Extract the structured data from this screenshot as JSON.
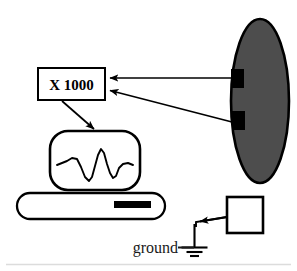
{
  "figure": {
    "background_color": "#ffffff",
    "width": 297,
    "height": 271
  },
  "amplifier": {
    "label": "X 1000",
    "box": {
      "x": 38,
      "y": 68,
      "width": 67,
      "height": 32
    },
    "stroke_color": "#000000",
    "fill_color": "#ffffff"
  },
  "subject": {
    "shape": "ellipse",
    "fill_color": "#4d4d4d",
    "stroke_color": "#000000",
    "center": {
      "x": 260,
      "y": 101
    },
    "radius": {
      "x": 29,
      "y": 82
    }
  },
  "electrodes": [
    {
      "name": "electrode-upper",
      "fill_color": "#000000",
      "rect": {
        "x": 231,
        "y": 69,
        "width": 13,
        "height": 19
      }
    },
    {
      "name": "electrode-lower",
      "fill_color": "#000000",
      "rect": {
        "x": 232,
        "y": 111,
        "width": 13,
        "height": 19
      }
    }
  ],
  "signal_arrows": [
    {
      "name": "electrode-upper-to-amplifier",
      "from": {
        "x": 231,
        "y": 78
      },
      "to": {
        "x": 107,
        "y": 78
      }
    },
    {
      "name": "electrode-lower-to-amplifier",
      "from": {
        "x": 232,
        "y": 122
      },
      "to": {
        "x": 107,
        "y": 90
      }
    },
    {
      "name": "amplifier-to-monitor",
      "from": {
        "x": 63,
        "y": 103
      },
      "to": {
        "x": 93,
        "y": 128
      }
    },
    {
      "name": "ground-box-to-ground-symbol",
      "from": {
        "x": 219,
        "y": 218
      },
      "to": {
        "x": 194,
        "y": 227
      }
    }
  ],
  "monitor": {
    "name": "oscilloscope-monitor",
    "screen": {
      "x": 50,
      "y": 131,
      "width": 90,
      "height": 59,
      "radius": 18
    },
    "stroke_color": "#000000",
    "fill_color": "#ffffff",
    "waveform": {
      "description": "biphasic action potential trace",
      "stroke_color": "#000000",
      "points": "57,165 63,163 69,161 74,158 79,160 83,168 87,178 90,181 93,177 96,166 99,155 102,150 105,154 108,165 111,174 114,178 117,175 120,168 124,164 128,163 133,165"
    }
  },
  "base_unit": {
    "name": "instrument-base",
    "body": {
      "x": 17,
      "y": 193,
      "width": 148,
      "height": 26,
      "radius": 13
    },
    "stroke_color": "#000000",
    "fill_color": "#ffffff",
    "slot": {
      "x": 114,
      "y": 201,
      "width": 37,
      "height": 7,
      "fill_color": "#000000"
    }
  },
  "ground": {
    "label": "ground",
    "box": {
      "x": 227,
      "y": 197,
      "width": 36,
      "height": 36
    },
    "box_stroke_color": "#000000",
    "box_fill_color": "#ffffff",
    "symbol": {
      "name": "earth-ground-symbol",
      "stem": {
        "x": 194,
        "y_top": 227,
        "y_bottom": 247
      },
      "bars": [
        {
          "y": 247,
          "half_width": 13
        },
        {
          "y": 251,
          "half_width": 8
        },
        {
          "y": 255,
          "half_width": 4
        }
      ]
    }
  },
  "footer_rule": {
    "name": "bottom-divider",
    "y": 264,
    "color": "#dcdcdc"
  }
}
